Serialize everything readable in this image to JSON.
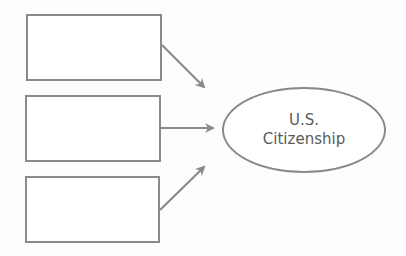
{
  "diagram": {
    "type": "concept-map",
    "input_boxes": [
      {
        "id": "box-1",
        "label": ""
      },
      {
        "id": "box-2",
        "label": ""
      },
      {
        "id": "box-3",
        "label": ""
      }
    ],
    "target": {
      "shape": "ellipse",
      "line1": "U.S.",
      "line2": "Citizenship"
    },
    "arrows": [
      {
        "from": "box-1",
        "to": "target"
      },
      {
        "from": "box-2",
        "to": "target"
      },
      {
        "from": "box-3",
        "to": "target"
      }
    ],
    "colors": {
      "stroke": "#8a8a8a",
      "text": "#5a5a5a",
      "background": "#ffffff"
    }
  }
}
